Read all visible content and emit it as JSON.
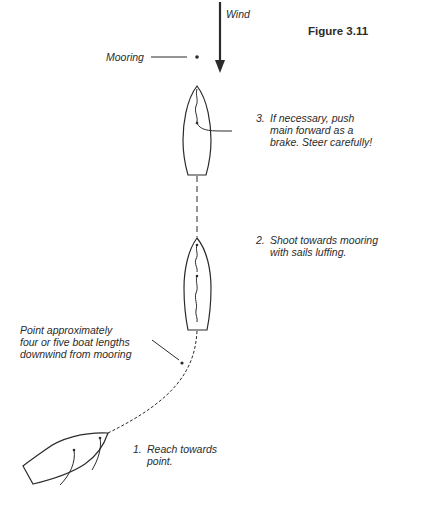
{
  "figure": {
    "title": "Figure 3.11",
    "wind_label": "Wind",
    "mooring_label": "Mooring",
    "point_label": {
      "lines": [
        "Point approximately",
        "four or five boat lengths",
        "downwind from mooring"
      ]
    },
    "steps": [
      {
        "number": "1.",
        "lines": [
          "Reach towards",
          "point."
        ]
      },
      {
        "number": "2.",
        "lines": [
          "Shoot towards mooring",
          "with sails luffing."
        ]
      },
      {
        "number": "3.",
        "lines": [
          "If necessary, push",
          "main forward as a",
          "brake. Steer carefully!"
        ]
      }
    ]
  },
  "colors": {
    "ink": "#2b2b2b",
    "background": "#ffffff"
  },
  "icons": {
    "wind_arrow": "down-arrow",
    "mooring": "dot",
    "boats": [
      "sailboat-top-view-reaching",
      "sailboat-top-view-luffing",
      "sailboat-top-view-braking"
    ]
  }
}
